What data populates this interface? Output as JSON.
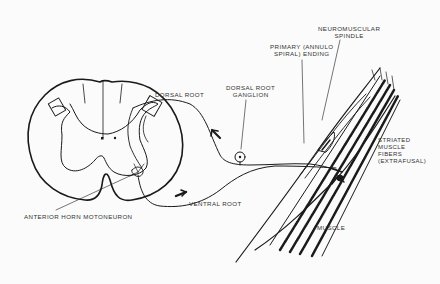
{
  "diagram": {
    "type": "anatomical-illustration",
    "labels": {
      "neuromuscular_spindle": "NEUROMUSCULAR\nSPINDLE",
      "primary_annulo_spiral_ending": "PRIMARY (ANNULO\nSPIRAL) ENDING",
      "dorsal_root": "DORSAL ROOT",
      "dorsal_root_ganglion": "DORSAL ROOT\nGANGLION",
      "striated_muscle_fibers": "STRIATED\nMUSCLE\nFIBERS\n(EXTRAFUSAL)",
      "anterior_horn_motoneuron": "ANTERIOR HORN MOTONEURON",
      "ventral_root": "VENTRAL ROOT",
      "muscle": "MUSCLE"
    },
    "colors": {
      "ink": "#1a1a1a",
      "background": "#fbfbfb"
    }
  }
}
